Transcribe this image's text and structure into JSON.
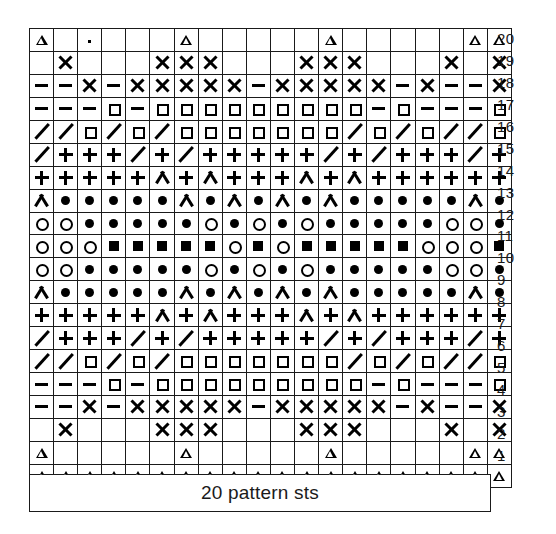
{
  "chart_data": {
    "type": "table",
    "title": "20 pattern sts",
    "xlabel": "",
    "ylabel": "",
    "grid": true,
    "columns": 20,
    "rows": 20,
    "row_numbers": [
      20,
      19,
      18,
      17,
      16,
      15,
      14,
      13,
      12,
      11,
      10,
      9,
      8,
      7,
      6,
      5,
      4,
      3,
      2,
      1
    ],
    "symbol_legend": {
      "blank": "blank",
      "triangle": "open-triangle",
      "cross": "cross-x",
      "dash": "dash",
      "square": "open-square",
      "fsquare": "filled-square",
      "slash": "slash",
      "plus": "plus",
      "caret": "caret-chevron",
      "dot": "filled-dot",
      "circle": "open-circle",
      "speck": "speck"
    },
    "grid_rows": [
      {
        "row": 20,
        "cells": [
          "triangle",
          "blank",
          "speck",
          "blank",
          "blank",
          "blank",
          "triangle",
          "blank",
          "blank",
          "blank",
          "blank",
          "blank",
          "triangle",
          "blank",
          "blank",
          "blank",
          "blank",
          "blank",
          "triangle",
          "triangle"
        ]
      },
      {
        "row": 19,
        "cells": [
          "blank",
          "cross",
          "blank",
          "blank",
          "blank",
          "cross",
          "cross",
          "cross",
          "blank",
          "blank",
          "blank",
          "cross",
          "cross",
          "cross",
          "blank",
          "blank",
          "blank",
          "cross",
          "blank",
          "cross"
        ]
      },
      {
        "row": 18,
        "cells": [
          "dash",
          "dash",
          "cross",
          "dash",
          "cross",
          "cross",
          "cross",
          "cross",
          "cross",
          "dash",
          "cross",
          "cross",
          "cross",
          "cross",
          "cross",
          "dash",
          "cross",
          "dash",
          "dash",
          "cross"
        ]
      },
      {
        "row": 17,
        "cells": [
          "dash",
          "dash",
          "dash",
          "square",
          "dash",
          "square",
          "square",
          "square",
          "square",
          "square",
          "square",
          "square",
          "square",
          "square",
          "dash",
          "square",
          "dash",
          "dash",
          "dash",
          "square"
        ]
      },
      {
        "row": 16,
        "cells": [
          "slash",
          "slash",
          "square",
          "slash",
          "square",
          "slash",
          "square",
          "square",
          "square",
          "square",
          "square",
          "square",
          "square",
          "slash",
          "square",
          "slash",
          "square",
          "slash",
          "slash",
          "square"
        ]
      },
      {
        "row": 15,
        "cells": [
          "slash",
          "plus",
          "plus",
          "plus",
          "slash",
          "plus",
          "slash",
          "plus",
          "plus",
          "plus",
          "plus",
          "plus",
          "slash",
          "plus",
          "slash",
          "plus",
          "plus",
          "plus",
          "slash",
          "plus"
        ]
      },
      {
        "row": 14,
        "cells": [
          "plus",
          "plus",
          "plus",
          "plus",
          "plus",
          "caret",
          "plus",
          "caret",
          "plus",
          "plus",
          "plus",
          "caret",
          "plus",
          "caret",
          "plus",
          "plus",
          "plus",
          "plus",
          "plus",
          "plus"
        ]
      },
      {
        "row": 13,
        "cells": [
          "caret",
          "dot",
          "dot",
          "dot",
          "dot",
          "dot",
          "caret",
          "dot",
          "caret",
          "dot",
          "caret",
          "dot",
          "caret",
          "dot",
          "dot",
          "dot",
          "dot",
          "dot",
          "caret",
          "dot"
        ]
      },
      {
        "row": 12,
        "cells": [
          "circle",
          "circle",
          "dot",
          "dot",
          "dot",
          "dot",
          "dot",
          "circle",
          "dot",
          "circle",
          "dot",
          "circle",
          "dot",
          "dot",
          "dot",
          "dot",
          "dot",
          "circle",
          "circle",
          "dot"
        ]
      },
      {
        "row": 11,
        "cells": [
          "circle",
          "circle",
          "circle",
          "fsquare",
          "fsquare",
          "fsquare",
          "fsquare",
          "fsquare",
          "circle",
          "fsquare",
          "circle",
          "fsquare",
          "fsquare",
          "fsquare",
          "fsquare",
          "fsquare",
          "circle",
          "circle",
          "circle",
          "fsquare"
        ]
      },
      {
        "row": 10,
        "cells": [
          "circle",
          "circle",
          "dot",
          "dot",
          "dot",
          "dot",
          "dot",
          "circle",
          "dot",
          "circle",
          "dot",
          "circle",
          "dot",
          "dot",
          "dot",
          "dot",
          "dot",
          "circle",
          "circle",
          "dot"
        ]
      },
      {
        "row": 9,
        "cells": [
          "caret",
          "dot",
          "dot",
          "dot",
          "dot",
          "dot",
          "caret",
          "dot",
          "caret",
          "dot",
          "caret",
          "dot",
          "caret",
          "dot",
          "dot",
          "dot",
          "dot",
          "dot",
          "caret",
          "dot"
        ]
      },
      {
        "row": 8,
        "cells": [
          "plus",
          "plus",
          "plus",
          "plus",
          "plus",
          "caret",
          "plus",
          "caret",
          "plus",
          "plus",
          "plus",
          "caret",
          "plus",
          "caret",
          "plus",
          "plus",
          "plus",
          "plus",
          "plus",
          "plus"
        ]
      },
      {
        "row": 7,
        "cells": [
          "slash",
          "plus",
          "plus",
          "plus",
          "slash",
          "plus",
          "slash",
          "plus",
          "plus",
          "plus",
          "plus",
          "plus",
          "slash",
          "plus",
          "slash",
          "plus",
          "plus",
          "plus",
          "slash",
          "plus"
        ]
      },
      {
        "row": 6,
        "cells": [
          "slash",
          "slash",
          "square",
          "slash",
          "square",
          "slash",
          "square",
          "square",
          "square",
          "square",
          "square",
          "square",
          "square",
          "slash",
          "square",
          "slash",
          "square",
          "slash",
          "slash",
          "square"
        ]
      },
      {
        "row": 5,
        "cells": [
          "dash",
          "dash",
          "dash",
          "square",
          "dash",
          "square",
          "square",
          "square",
          "square",
          "square",
          "square",
          "square",
          "square",
          "square",
          "dash",
          "square",
          "dash",
          "dash",
          "dash",
          "square"
        ]
      },
      {
        "row": 4,
        "cells": [
          "dash",
          "dash",
          "cross",
          "dash",
          "cross",
          "cross",
          "cross",
          "cross",
          "cross",
          "dash",
          "cross",
          "cross",
          "cross",
          "cross",
          "cross",
          "dash",
          "cross",
          "dash",
          "dash",
          "cross"
        ]
      },
      {
        "row": 3,
        "cells": [
          "blank",
          "cross",
          "blank",
          "blank",
          "blank",
          "cross",
          "cross",
          "cross",
          "blank",
          "blank",
          "blank",
          "cross",
          "cross",
          "cross",
          "blank",
          "blank",
          "blank",
          "cross",
          "blank",
          "cross"
        ]
      },
      {
        "row": 2,
        "cells": [
          "triangle",
          "blank",
          "blank",
          "blank",
          "blank",
          "blank",
          "triangle",
          "blank",
          "blank",
          "blank",
          "blank",
          "blank",
          "triangle",
          "blank",
          "blank",
          "blank",
          "blank",
          "blank",
          "triangle",
          "triangle"
        ]
      },
      {
        "row": 1,
        "cells": [
          "triangle",
          "triangle",
          "triangle",
          "triangle",
          "triangle",
          "triangle",
          "triangle",
          "triangle",
          "triangle",
          "triangle",
          "triangle",
          "triangle",
          "triangle",
          "triangle",
          "triangle",
          "triangle",
          "triangle",
          "triangle",
          "triangle",
          "triangle"
        ]
      }
    ]
  },
  "footer": {
    "label": "20 pattern sts"
  },
  "colors": {
    "ink": "#1a1a1a",
    "paper": "#ffffff"
  }
}
